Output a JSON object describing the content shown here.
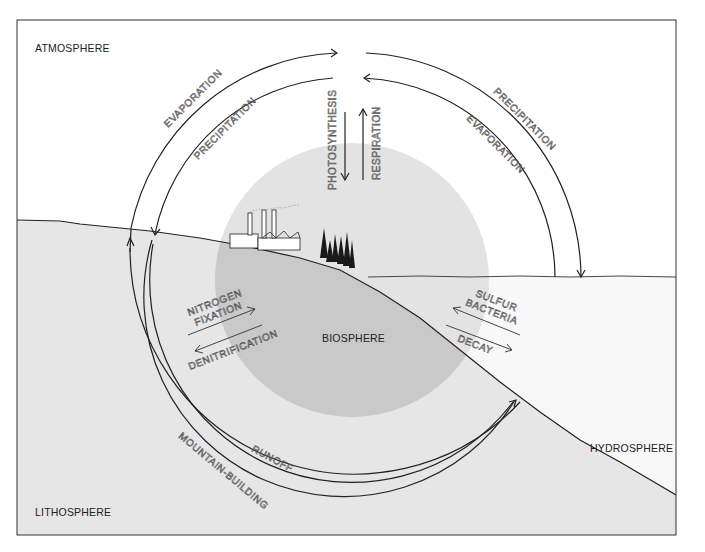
{
  "diagram": {
    "title": "",
    "colors": {
      "background": "#ffffff",
      "land": "#e6e6e6",
      "biosphere_air": "#e3e3e3",
      "biosphere_land": "#c9c9c9",
      "water": "#f8f8f8",
      "line": "#222222"
    },
    "spheres": {
      "atmosphere": "ATMOSPHERE",
      "lithosphere": "LITHOSPHERE",
      "hydrosphere": "HYDROSPHERE",
      "biosphere": "BIOSPHERE"
    },
    "processes": {
      "left_outer_up": "EVAPORATION",
      "left_inner_down": "PRECIPITATION",
      "right_outer_down": "PRECIPITATION",
      "right_inner_up": "EVAPORATION",
      "photosynthesis": "PHOTOSYNTHESIS",
      "respiration": "RESPIRATION",
      "nitrogen_fixation_line1": "NITROGEN",
      "nitrogen_fixation_line2": "FIXATION",
      "denitrification": "DENITRIFICATION",
      "sulfur_bacteria_line1": "SULFUR",
      "sulfur_bacteria_line2": "BACTERIA",
      "decay": "DECAY",
      "runoff": "RUNOFF",
      "mountain_building": "MOUNTAIN-BUILDING"
    },
    "icons": [
      "factory-icon",
      "pine-trees-icon"
    ]
  }
}
